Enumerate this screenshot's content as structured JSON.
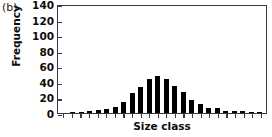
{
  "figure": {
    "panel_label": "(b)",
    "background_color": "#ffffff",
    "bar_color": "#000000",
    "axis_color": "#3c3c3c"
  },
  "chart_data": {
    "type": "bar",
    "title": "",
    "subtitle": "",
    "panel": "(b)",
    "xlabel": "Size class",
    "ylabel": "Frequency",
    "ylim": [
      0,
      140
    ],
    "ytick_labels": [
      "140",
      "120",
      "100",
      "80",
      "60",
      "40",
      "20",
      "0"
    ],
    "yticks": [
      140,
      120,
      100,
      80,
      60,
      40,
      20,
      0
    ],
    "ytick_step": 20,
    "grid": false,
    "legend": null,
    "xtick_labels": [],
    "categories": [
      "1",
      "2",
      "3",
      "4",
      "5",
      "6",
      "7",
      "8",
      "9",
      "10",
      "11",
      "12",
      "13",
      "14",
      "15",
      "16",
      "17",
      "18",
      "19",
      "20",
      "21",
      "22",
      "23",
      "24"
    ],
    "values": [
      0,
      1,
      1,
      2,
      4,
      5,
      8,
      14,
      26,
      34,
      44,
      48,
      44,
      35,
      27,
      17,
      11,
      7,
      6,
      3,
      3,
      2,
      1,
      1
    ],
    "n_bars": 24,
    "peak_value": 48,
    "peak_category": "12"
  }
}
